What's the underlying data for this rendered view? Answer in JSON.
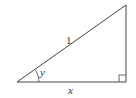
{
  "diagram": {
    "type": "right-triangle",
    "stroke_color": "#444444",
    "vertices": {
      "left": [
        17,
        82
      ],
      "right": [
        126,
        82
      ],
      "top": [
        126,
        5
      ]
    },
    "labels": {
      "hypotenuse": "1",
      "angle": "y",
      "base": "x"
    },
    "right_angle_marker": true
  }
}
